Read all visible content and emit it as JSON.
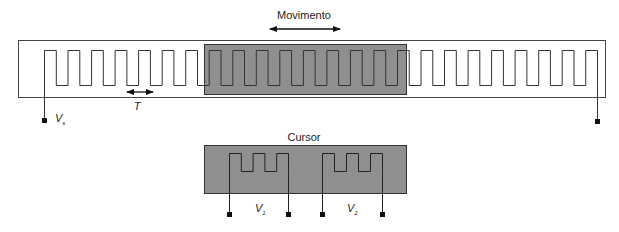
{
  "diagram": {
    "title_arrow_label": "Movimento",
    "period_label": "T",
    "cursor_label": "Cursor",
    "terminals": {
      "scale": {
        "symbol": "V",
        "subscript": "s"
      },
      "cursor_1": {
        "symbol": "V",
        "subscript": "1"
      },
      "cursor_2": {
        "symbol": "V",
        "subscript": "2"
      }
    },
    "scale": {
      "description": "Scale winding (long meander)",
      "period_count": 24
    },
    "slider": {
      "description": "Sliding cursor overlay on scale",
      "period_count": 9
    },
    "cursor": {
      "windings": [
        {
          "name": "V1 winding",
          "teeth": 3
        },
        {
          "name": "V2 winding",
          "teeth": 3
        }
      ]
    },
    "colors": {
      "line": "#333333",
      "slider_fill": "#8f8f8f",
      "background": "#ffffff"
    }
  }
}
